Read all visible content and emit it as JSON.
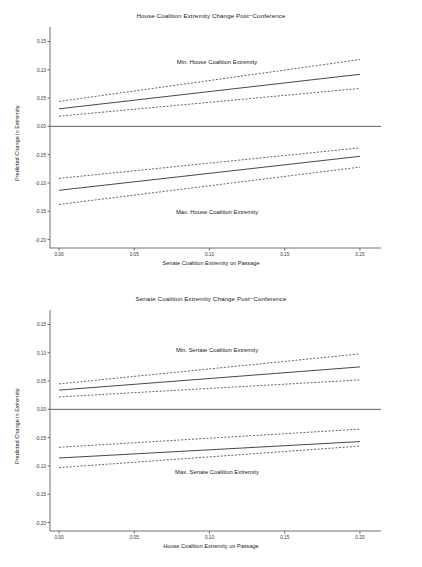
{
  "figure": {
    "background": "#ffffff",
    "line_color": "#333333",
    "axis_color": "#4d4d4d"
  },
  "chart_data": [
    {
      "type": "line",
      "title": "House Coalition Extremity Change Post−Conference",
      "xlabel": "Senate Coalition Extremity on Passage",
      "ylabel": "Predicted Change in Extremity",
      "xlim": [
        -0.006,
        0.214
      ],
      "ylim": [
        -0.215,
        0.165
      ],
      "xticks": [
        0.0,
        0.05,
        0.1,
        0.15,
        0.2
      ],
      "xticklabels": [
        "0.00",
        "0.05",
        "0.10",
        "0.15",
        "0.20"
      ],
      "yticks": [
        0.15,
        0.1,
        0.05,
        0.0,
        -0.05,
        -0.1,
        -0.15,
        -0.2
      ],
      "yticklabels": [
        "0.15",
        "0.10",
        "0.05",
        "0.00",
        "-0.05",
        "-0.10",
        "-0.15",
        "-0.20"
      ],
      "grid": false,
      "legend": "none",
      "x": [
        0.0,
        0.2
      ],
      "zero_line": 0.0,
      "annotations": [
        {
          "text": "Min. House Coalition Extremity",
          "x": 0.105,
          "y": 0.112
        },
        {
          "text": "Max. House Coalition Extremity",
          "x": 0.105,
          "y": -0.153
        }
      ],
      "series": [
        {
          "name": "Min. House Coalition Extremity — fit",
          "style": "solid",
          "values": [
            0.031,
            0.092
          ]
        },
        {
          "name": "Min. House Coalition Extremity — upper CI",
          "style": "dashed",
          "values": [
            0.044,
            0.118
          ]
        },
        {
          "name": "Min. House Coalition Extremity — lower CI",
          "style": "dashed",
          "values": [
            0.018,
            0.067
          ]
        },
        {
          "name": "Max. House Coalition Extremity — fit",
          "style": "solid",
          "values": [
            -0.113,
            -0.053
          ]
        },
        {
          "name": "Max. House Coalition Extremity — upper CI",
          "style": "dashed",
          "values": [
            -0.092,
            -0.038
          ]
        },
        {
          "name": "Max. House Coalition Extremity — lower CI",
          "style": "dashed",
          "values": [
            -0.138,
            -0.072
          ]
        }
      ]
    },
    {
      "type": "line",
      "title": "Senate Coalition Extremity Change Post−Conference",
      "xlabel": "House Coalition Extremity on Passage",
      "ylabel": "Predicted Change in Extremity",
      "xlim": [
        -0.006,
        0.214
      ],
      "ylim": [
        -0.215,
        0.165
      ],
      "xticks": [
        0.0,
        0.05,
        0.1,
        0.15,
        0.2
      ],
      "xticklabels": [
        "0.00",
        "0.05",
        "0.10",
        "0.15",
        "0.20"
      ],
      "yticks": [
        0.15,
        0.1,
        0.05,
        0.0,
        -0.05,
        -0.1,
        -0.15,
        -0.2
      ],
      "yticklabels": [
        "0.15",
        "0.10",
        "0.05",
        "0.00",
        "-0.05",
        "-0.10",
        "-0.15",
        "-0.20"
      ],
      "grid": false,
      "legend": "none",
      "x": [
        0.0,
        0.2
      ],
      "zero_line": 0.0,
      "annotations": [
        {
          "text": "Min. Senate Coalition Extremity",
          "x": 0.105,
          "y": 0.103
        },
        {
          "text": "Max. Senate Coalition Extremity",
          "x": 0.105,
          "y": -0.112
        }
      ],
      "series": [
        {
          "name": "Min. Senate Coalition Extremity — fit",
          "style": "solid",
          "values": [
            0.034,
            0.075
          ]
        },
        {
          "name": "Min. Senate Coalition Extremity — upper CI",
          "style": "dashed",
          "values": [
            0.045,
            0.098
          ]
        },
        {
          "name": "Min. Senate Coalition Extremity — lower CI",
          "style": "dashed",
          "values": [
            0.022,
            0.052
          ]
        },
        {
          "name": "Max. Senate Coalition Extremity — fit",
          "style": "solid",
          "values": [
            -0.086,
            -0.057
          ]
        },
        {
          "name": "Max. Senate Coalition Extremity — upper CI",
          "style": "dashed",
          "values": [
            -0.067,
            -0.035
          ]
        },
        {
          "name": "Max. Senate Coalition Extremity — lower CI",
          "style": "dashed",
          "values": [
            -0.103,
            -0.065
          ]
        }
      ]
    }
  ]
}
